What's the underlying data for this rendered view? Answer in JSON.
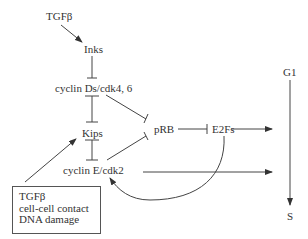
{
  "diagram": {
    "nodes": {
      "tgfb_top": "TGFβ",
      "inks": "Inks",
      "cyclin_d": "cyclin Ds/cdk4, 6",
      "kips": "Kips",
      "cyclin_e": "cyclin E/cdk2",
      "prb": "pRB",
      "e2fs": "E2Fs",
      "g1": "G1",
      "s": "S"
    },
    "box": {
      "lines": [
        "TGFβ",
        "cell-cell contact",
        "DNA damage"
      ]
    },
    "edges": [
      {
        "from": "TGFβ",
        "to": "Inks",
        "type": "activation"
      },
      {
        "from": "Inks",
        "to": "cyclin Ds/cdk4, 6",
        "type": "inhibition"
      },
      {
        "from": "cyclin Ds/cdk4, 6",
        "to": "Kips",
        "type": "inhibition"
      },
      {
        "from": "Kips",
        "to": "cyclin E/cdk2",
        "type": "inhibition"
      },
      {
        "from": "cyclin Ds/cdk4, 6",
        "to": "pRB",
        "type": "inhibition"
      },
      {
        "from": "cyclin E/cdk2",
        "to": "pRB",
        "type": "inhibition"
      },
      {
        "from": "pRB",
        "to": "E2Fs",
        "type": "inhibition"
      },
      {
        "from": "E2Fs",
        "to": "G1→S",
        "type": "activation"
      },
      {
        "from": "cyclin E/cdk2",
        "to": "G1→S",
        "type": "activation"
      },
      {
        "from": "E2Fs",
        "to": "cyclin E/cdk2",
        "type": "activation"
      },
      {
        "from": "TGFβ / cell-cell contact / DNA damage",
        "to": "Kips",
        "type": "activation"
      },
      {
        "from": "G1",
        "to": "S",
        "type": "progression"
      }
    ]
  }
}
